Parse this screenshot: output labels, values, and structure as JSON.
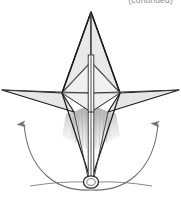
{
  "figure": {
    "caption_continued": "(continued)",
    "alt_description": "Line diagram of a symmetric star/arrow shaped deployable structure with a central vertical mast, two upper spar triangles, two horizontal wing panels, a shaded fan region below, a pivot hinge circle at the base, and two upward curved rotation arrows indicating the wings swing upward about the base pivot."
  },
  "colors": {
    "background": "#ffffff",
    "outline_dark": "#1a1a1a",
    "outline_mid": "#4f4f4f",
    "outline_light": "#8c8c8c",
    "panel_fill": "#e9e9e9",
    "panel_fill_light": "#f1f1f1",
    "panel_fill_dark": "#dedede",
    "shade_fan_top": "#bdbdbd",
    "shade_fan_bottom": "#ededed",
    "mast_fill": "#ffffff",
    "mast_core": "#5a5a5a",
    "arrow_stroke": "#6e6e6e",
    "caption_text": "#8d8d8d"
  },
  "geometry": {
    "canvas": {
      "width": 181,
      "height": 198
    },
    "apex": {
      "x": 91,
      "y": 12
    },
    "wing_line_y": 93,
    "left_wing_tip": {
      "x": 2,
      "y": 90
    },
    "right_wing_tip": {
      "x": 179,
      "y": 90
    },
    "left_node": {
      "x": 62,
      "y": 93
    },
    "right_node": {
      "x": 120,
      "y": 93
    },
    "upper_node_y": 62,
    "lower_node_y": 112,
    "pivot": {
      "x": 91,
      "y": 182,
      "rx": 7,
      "ry": 6
    },
    "mast": {
      "x": 91,
      "top_y": 55,
      "bottom_y": 182,
      "width": 6
    }
  },
  "parts": [
    {
      "id": "upper-spar-left",
      "name": "upper-left-spar-panel",
      "label": "Upper left spar panel"
    },
    {
      "id": "upper-spar-right",
      "name": "upper-right-spar-panel",
      "label": "Upper right spar panel"
    },
    {
      "id": "wing-left",
      "name": "left-wing-panel",
      "label": "Left wing panel"
    },
    {
      "id": "wing-right",
      "name": "right-wing-panel",
      "label": "Right wing panel"
    },
    {
      "id": "mid-diamond",
      "name": "central-diamond-frame",
      "label": "Central diamond frame"
    },
    {
      "id": "shade-fan",
      "name": "shaded-fan-region",
      "label": "Shaded fan region"
    },
    {
      "id": "mast",
      "name": "central-mast",
      "label": "Central mast"
    },
    {
      "id": "pivot",
      "name": "base-pivot-hinge",
      "label": "Base pivot hinge"
    }
  ],
  "annotations": {
    "left_arrow": {
      "name": "left-rotation-arrow",
      "direction": "upward",
      "meaning": "left wing rotates up about base pivot"
    },
    "right_arrow": {
      "name": "right-rotation-arrow",
      "direction": "upward",
      "meaning": "right wing rotates up about base pivot"
    }
  }
}
